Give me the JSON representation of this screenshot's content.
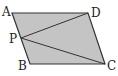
{
  "diagram": {
    "type": "geometry",
    "shape": "parallelogram",
    "fill_color": "#c4c4c4",
    "stroke_color": "#333333",
    "points": {
      "A": {
        "label": "A",
        "x": 12,
        "y": 13
      },
      "D": {
        "label": "D",
        "x": 88,
        "y": 13
      },
      "C": {
        "label": "C",
        "x": 105,
        "y": 64
      },
      "B": {
        "label": "B",
        "x": 30,
        "y": 64
      },
      "P": {
        "label": "P",
        "x": 21,
        "y": 38
      }
    },
    "segments": [
      "AD",
      "DC",
      "CB",
      "BA",
      "PD",
      "PC"
    ]
  }
}
